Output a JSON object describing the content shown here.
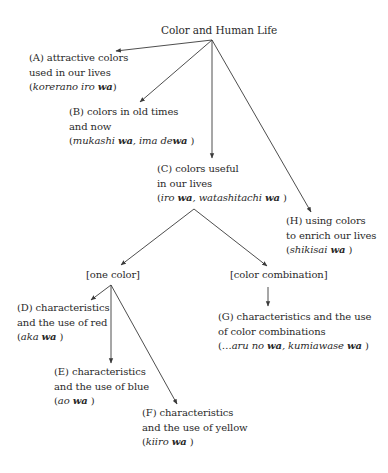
{
  "diagram": {
    "type": "tree",
    "title": "Color and Human Life",
    "nodes": {
      "A": {
        "lines": [
          "(A) attractive colors",
          "used in our lives"
        ],
        "paren": {
          "italic": "korerano iro ",
          "bold": "wa",
          "tail": ""
        }
      },
      "B": {
        "lines": [
          "(B) colors in old times",
          "and now"
        ],
        "paren": {
          "italic": "mukashi ",
          "bold": "wa",
          "mid": ", ima de",
          "bold2": "wa"
        }
      },
      "C": {
        "lines": [
          "(C) colors useful",
          "in our lives"
        ],
        "paren": {
          "italic": "iro ",
          "bold": "wa",
          "mid": ", watashitachi ",
          "bold2": "wa"
        }
      },
      "H": {
        "lines": [
          "(H) using colors",
          "to enrich our lives"
        ],
        "paren": {
          "italic": "shikisai ",
          "bold": "wa"
        }
      },
      "one_color": {
        "label": "[one color]"
      },
      "color_combination": {
        "label": "[color combination]"
      },
      "D": {
        "lines": [
          "(D) characteristics",
          "and the use of red"
        ],
        "paren": {
          "italic": "aka ",
          "bold": "wa"
        }
      },
      "E": {
        "lines": [
          "(E) characteristics",
          "and the use of blue"
        ],
        "paren": {
          "italic": "ao ",
          "bold": "wa"
        }
      },
      "F": {
        "lines": [
          "(F) characteristics",
          "and the use of yellow"
        ],
        "paren": {
          "italic": "kiiro ",
          "bold": "wa"
        }
      },
      "G": {
        "lines": [
          "(G) characteristics and the use",
          "of color combinations"
        ],
        "paren": {
          "italic": "…aru no ",
          "bold": "wa",
          "mid": ", kumiawase ",
          "bold2": "wa"
        }
      }
    },
    "edges": [
      [
        "root",
        "A"
      ],
      [
        "root",
        "B"
      ],
      [
        "root",
        "C"
      ],
      [
        "root",
        "H"
      ],
      [
        "C",
        "one_color"
      ],
      [
        "C",
        "color_combination"
      ],
      [
        "one_color",
        "D"
      ],
      [
        "one_color",
        "E"
      ],
      [
        "one_color",
        "F"
      ],
      [
        "color_combination",
        "G"
      ]
    ],
    "colors": {
      "line": "#3a3a3a",
      "text": "#2a2a2a",
      "background": "#ffffff"
    }
  }
}
